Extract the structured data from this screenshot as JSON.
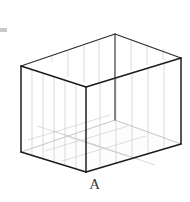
{
  "figure": {
    "label": "A",
    "kind": "open-top-rectangular-box",
    "projection": "oblique",
    "line_color": "#1c1c1c",
    "guide_color": "#c8c8c8",
    "background_color": "#ffffff",
    "label_color": "#3b3b3b",
    "canvas": {
      "width": 190,
      "height": 202
    }
  },
  "geometry": {
    "vertices": {
      "top_back_left": {
        "x": 21,
        "y": 66
      },
      "top_back_top": {
        "x": 115,
        "y": 34
      },
      "top_front_center": {
        "x": 86,
        "y": 87
      },
      "top_right": {
        "x": 181,
        "y": 58
      },
      "bottom_back_left": {
        "x": 21,
        "y": 152
      },
      "bottom_front_center": {
        "x": 86,
        "y": 172
      },
      "bottom_right": {
        "x": 181,
        "y": 144
      },
      "floor_back_corner": {
        "x": 115,
        "y": 120
      }
    },
    "edges": [
      {
        "name": "top-rim-left-back",
        "from": "top_back_left",
        "to": "top_back_top"
      },
      {
        "name": "top-rim-back-right",
        "from": "top_back_top",
        "to": "top_right"
      },
      {
        "name": "top-rim-left-front",
        "from": "top_back_left",
        "to": "top_front_center"
      },
      {
        "name": "top-rim-front-right",
        "from": "top_front_center",
        "to": "top_right"
      },
      {
        "name": "vertical-left",
        "from": "top_back_left",
        "to": "bottom_back_left"
      },
      {
        "name": "vertical-front",
        "from": "top_front_center",
        "to": "bottom_front_center"
      },
      {
        "name": "vertical-right",
        "from": "top_right",
        "to": "bottom_right"
      },
      {
        "name": "vertical-back-hidden",
        "from": "top_back_top",
        "to": "floor_back_corner"
      },
      {
        "name": "floor-left-front",
        "from": "bottom_back_left",
        "to": "bottom_front_center"
      },
      {
        "name": "floor-front-right",
        "from": "bottom_front_center",
        "to": "bottom_right"
      },
      {
        "name": "floor-left-back-faint",
        "from": "bottom_back_left",
        "to": "floor_back_corner"
      },
      {
        "name": "floor-back-right-faint",
        "from": "floor_back_corner",
        "to": "bottom_right"
      }
    ],
    "guide_line_count_left_face": 5,
    "guide_line_count_right_face": 5,
    "guide_line_count_floor": 6
  }
}
